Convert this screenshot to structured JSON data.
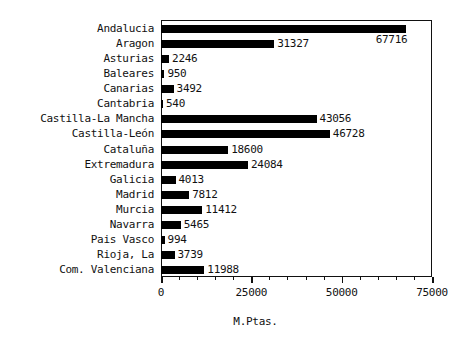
{
  "chart_data": {
    "type": "bar",
    "orientation": "horizontal",
    "title": "",
    "xlabel": "M.Ptas.",
    "ylabel": "",
    "xlim": [
      0,
      75000
    ],
    "xticks": [
      0,
      25000,
      50000,
      75000
    ],
    "xtick_labels": [
      "0",
      "25000",
      "50000",
      "75000"
    ],
    "minor_ticks_per_interval": 5,
    "grid": false,
    "legend": null,
    "bar_color": "#000000",
    "frame_color": "#111111",
    "background": "#ffffff",
    "value_labels_shown": true,
    "categories": [
      "Andalucia",
      "Aragon",
      "Asturias",
      "Baleares",
      "Canarias",
      "Cantabria",
      "Castilla-La Mancha",
      "Castilla-León",
      "Cataluña",
      "Extremadura",
      "Galicia",
      "Madrid",
      "Murcia",
      "Navarra",
      "Pais Vasco",
      "Rioja, La",
      "Com. Valenciana"
    ],
    "values": [
      67716,
      31327,
      2246,
      950,
      3492,
      540,
      43056,
      46728,
      18600,
      24084,
      4013,
      7812,
      11412,
      5465,
      994,
      3739,
      11988
    ],
    "value_label_text": [
      "67716",
      "31327",
      "2246",
      "950",
      "3492",
      "540",
      "43056",
      "46728",
      "18600",
      "24084",
      "4013",
      "7812",
      "11412",
      "5465",
      "994",
      "3739",
      "11988"
    ]
  }
}
